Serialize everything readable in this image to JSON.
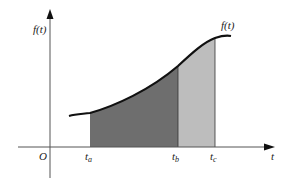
{
  "diagram": {
    "y_axis_label": "f(t)",
    "x_axis_label": "t",
    "origin_label": "O",
    "curve_label": "f(t)",
    "ticks": [
      {
        "base": "t",
        "sub": "a"
      },
      {
        "base": "t",
        "sub": "b"
      },
      {
        "base": "t",
        "sub": "c"
      }
    ],
    "colors": {
      "region_ta_tb": "#6e6e6e",
      "region_tb_tc": "#bdbdbd",
      "curve": "#111111",
      "axes": "#555555"
    }
  }
}
